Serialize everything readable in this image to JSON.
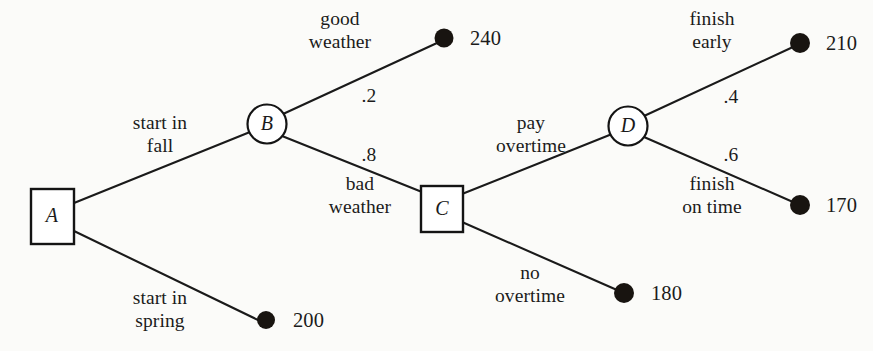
{
  "diagram": {
    "colors": {
      "line": "#1a1a1a",
      "node_fill": "#ffffff",
      "terminal_dot": "#181410",
      "background": "#fbfbf9",
      "text": "#1b1b1b"
    },
    "nodes": [
      {
        "id": "A",
        "label": "A",
        "shape": "square",
        "type": "decision",
        "x": 52,
        "y": 216
      },
      {
        "id": "B",
        "label": "B",
        "shape": "circle",
        "type": "chance",
        "x": 267,
        "y": 124
      },
      {
        "id": "C",
        "label": "C",
        "shape": "square",
        "type": "decision",
        "x": 442,
        "y": 209
      },
      {
        "id": "D",
        "label": "D",
        "shape": "circle",
        "type": "chance",
        "x": 628,
        "y": 126
      }
    ],
    "terminals": [
      {
        "id": "t240",
        "payoff": "240",
        "x": 444,
        "y": 38
      },
      {
        "id": "t200",
        "payoff": "200",
        "x": 266,
        "y": 320
      },
      {
        "id": "t210",
        "payoff": "210",
        "x": 800,
        "y": 43
      },
      {
        "id": "t170",
        "payoff": "170",
        "x": 800,
        "y": 205
      },
      {
        "id": "t180",
        "payoff": "180",
        "x": 624,
        "y": 293
      }
    ],
    "edges": [
      {
        "id": "a-b",
        "from": "A",
        "to": "B",
        "label_line1": "start in",
        "label_line2": "fall",
        "probability": ""
      },
      {
        "id": "a-t200",
        "from": "A",
        "to": "t200",
        "label_line1": "start in",
        "label_line2": "spring",
        "probability": ""
      },
      {
        "id": "b-t240",
        "from": "B",
        "to": "t240",
        "label_line1": "good",
        "label_line2": "weather",
        "probability": ".2"
      },
      {
        "id": "b-c",
        "from": "B",
        "to": "C",
        "label_line1": "bad",
        "label_line2": "weather",
        "probability": ".8"
      },
      {
        "id": "c-d",
        "from": "C",
        "to": "D",
        "label_line1": "pay",
        "label_line2": "overtime",
        "probability": ""
      },
      {
        "id": "c-t180",
        "from": "C",
        "to": "t180",
        "label_line1": "no",
        "label_line2": "overtime",
        "probability": ""
      },
      {
        "id": "d-t210",
        "from": "D",
        "to": "t210",
        "label_line1": "finish",
        "label_line2": "early",
        "probability": ".4"
      },
      {
        "id": "d-t170",
        "from": "D",
        "to": "t170",
        "label_line1": "finish",
        "label_line2": "on time",
        "probability": ".6"
      }
    ],
    "node_letters": {
      "A": "A",
      "B": "B",
      "C": "C",
      "D": "D"
    },
    "edge_label_text": {
      "start_in_fall_l1": "start in",
      "start_in_fall_l2": "fall",
      "start_in_spring_l1": "start in",
      "start_in_spring_l2": "spring",
      "good_weather_l1": "good",
      "good_weather_l2": "weather",
      "bad_weather_l1": "bad",
      "bad_weather_l2": "weather",
      "pay_overtime_l1": "pay",
      "pay_overtime_l2": "overtime",
      "no_overtime_l1": "no",
      "no_overtime_l2": "overtime",
      "finish_early_l1": "finish",
      "finish_early_l2": "early",
      "finish_on_time_l1": "finish",
      "finish_on_time_l2": "on time"
    },
    "probabilities": {
      "good_weather": ".2",
      "bad_weather": ".8",
      "finish_early": ".4",
      "finish_on_time": ".6"
    },
    "payoffs": {
      "good_weather": "240",
      "start_in_spring": "200",
      "finish_early": "210",
      "finish_on_time": "170",
      "no_overtime": "180"
    }
  }
}
